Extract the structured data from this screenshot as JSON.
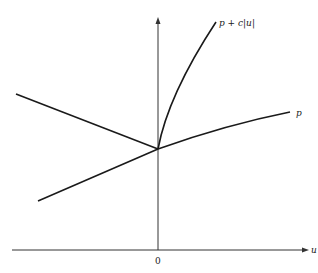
{
  "diagram": {
    "type": "function-graph",
    "axes": {
      "x_label": "u",
      "origin_label": "0"
    },
    "curves": [
      {
        "id": "p",
        "label": "p",
        "description": "concave increasing curve through the intersection point"
      },
      {
        "id": "p_plus_c_abs_u",
        "label": "p + c|u|",
        "description": "steep concave branch rising from intersection"
      },
      {
        "id": "left_upper",
        "label": "",
        "description": "line descending from upper-left to intersection"
      },
      {
        "id": "left_lower",
        "label": "",
        "description": "line rising from lower-left to intersection"
      }
    ],
    "colors": {
      "ink": "#1a1a1a",
      "axis": "#333333",
      "background": "#ffffff"
    }
  }
}
